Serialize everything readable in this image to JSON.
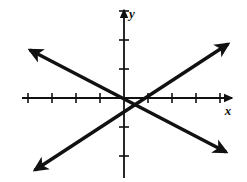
{
  "figure": {
    "kind": "coordinate-plane-line-graph",
    "background_color": "#ffffff",
    "stroke_color": "#111111",
    "width": 247,
    "height": 182
  },
  "axes": {
    "x": {
      "label": "x",
      "label_style": "italic",
      "arrowheads": "right",
      "tick_count_negative": 4,
      "tick_count_positive": 4,
      "tick_labels": [],
      "pixel_y": 98,
      "pixel_start_x": 22,
      "pixel_end_x": 232
    },
    "y": {
      "label": "y",
      "label_style": "italic",
      "arrowheads": "up",
      "tick_count_positive": 3,
      "tick_count_negative": 3,
      "tick_labels": [],
      "pixel_x": 124,
      "pixel_start_y": 10,
      "pixel_end_y": 178
    },
    "origin": {
      "x": 124,
      "y": 98
    },
    "tick_spacing_x": 24,
    "tick_spacing_y": 29,
    "tick_half_length": 5,
    "grid": "off"
  },
  "chart_data": {
    "type": "line",
    "title": "",
    "xlabel": "x",
    "ylabel": "y",
    "grid": false,
    "legend": "none",
    "xlim": [
      -4.3,
      4.5
    ],
    "ylim": [
      -3.0,
      3.0
    ],
    "series": [
      {
        "name": "rising-line",
        "description": "line through origin with positive slope, arrowheads both ends",
        "slope": 0.55,
        "intercept": 0,
        "x": [
          -4.25,
          4.4
        ],
        "values": [
          -2.34,
          2.42
        ],
        "arrow_start": true,
        "arrow_end": true
      },
      {
        "name": "falling-line",
        "description": "line through origin with negative slope, arrowheads both ends",
        "slope": -0.55,
        "intercept": 0,
        "x": [
          -4.25,
          4.4
        ],
        "values": [
          2.34,
          -2.42
        ],
        "arrow_start": true,
        "arrow_end": true
      }
    ],
    "intersection": {
      "x": 0,
      "y": 0
    }
  },
  "geometry": {
    "rising_line": {
      "x1": 35,
      "y1": 170,
      "x2": 228,
      "y2": 44
    },
    "falling_line": {
      "x1": 30,
      "y1": 50,
      "x2": 226,
      "y2": 152
    },
    "x_label_pos": {
      "x": 228,
      "y": 115
    },
    "y_label_pos": {
      "x": 132,
      "y": 18
    }
  }
}
